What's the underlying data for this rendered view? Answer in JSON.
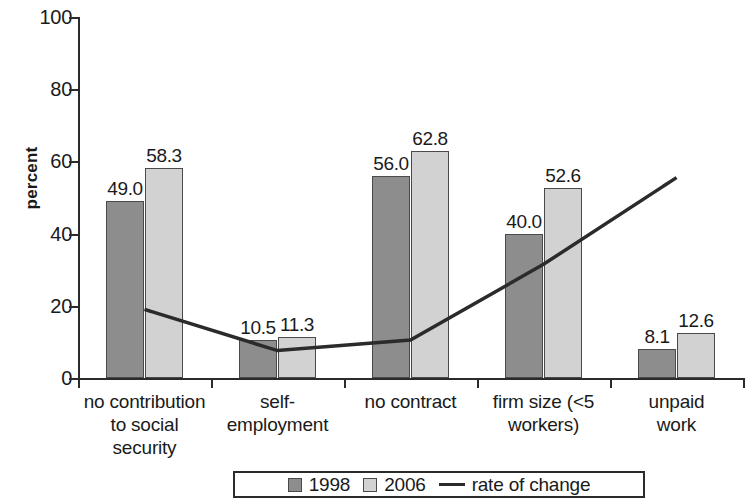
{
  "chart_data": {
    "type": "bar",
    "title": "",
    "subtitle": "",
    "xlabel": "",
    "ylabel": "percent",
    "ylim": [
      0,
      100
    ],
    "yticks": [
      0,
      20,
      40,
      60,
      80,
      100
    ],
    "ytick_labels": [
      "0",
      "20",
      "40",
      "60",
      "80",
      "100"
    ],
    "grid": false,
    "legend_position": "bottom-center",
    "categories": [
      "no contribution to social security",
      "self-employment",
      "no contract",
      "firm size (<5 workers)",
      "unpaid work"
    ],
    "category_label_lines": [
      [
        "no contribution",
        "to social",
        "security"
      ],
      [
        "self-",
        "employment"
      ],
      [
        "no contract"
      ],
      [
        "firm size (<5",
        "workers)"
      ],
      [
        "unpaid",
        "work"
      ]
    ],
    "series": [
      {
        "name": "1998",
        "type": "bar",
        "color": "#8d8d8d",
        "values": [
          49.0,
          10.5,
          56.0,
          40.0,
          8.1
        ],
        "value_labels": [
          "49.0",
          "10.5",
          "56.0",
          "40.0",
          "8.1"
        ]
      },
      {
        "name": "2006",
        "type": "bar",
        "color": "#d2d2d2",
        "values": [
          58.3,
          11.3,
          62.8,
          52.6,
          12.6
        ],
        "value_labels": [
          "58.3",
          "11.3",
          "62.8",
          "52.6",
          "12.6"
        ]
      },
      {
        "name": "rate of change",
        "type": "line",
        "color": "#2b2b2b",
        "values": [
          19.0,
          7.6,
          10.5,
          31.5,
          55.5
        ],
        "value_labels": []
      }
    ]
  },
  "legend": {
    "items": [
      {
        "label": "1998",
        "marker": "square-dark-swatch"
      },
      {
        "label": "2006",
        "marker": "square-light-swatch"
      },
      {
        "label": "rate of change",
        "marker": "line-marker"
      }
    ]
  }
}
